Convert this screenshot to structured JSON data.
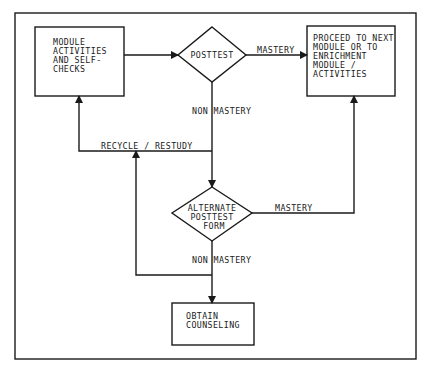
{
  "diagram": {
    "type": "flowchart",
    "colors": {
      "line": "#1a1a1a",
      "background": "#ffffff"
    },
    "nodes": {
      "module_activities": {
        "shape": "rectangle",
        "lines": [
          "MODULE",
          "ACTIVITIES",
          "AND SELF-",
          "CHECKS"
        ]
      },
      "posttest": {
        "shape": "diamond",
        "lines": [
          "POSTTEST"
        ]
      },
      "proceed": {
        "shape": "rectangle",
        "lines": [
          "PROCEED TO NEXT",
          "MODULE OR TO",
          "ENRICHMENT",
          "MODULE /",
          "ACTIVITIES"
        ]
      },
      "alternate_posttest": {
        "shape": "diamond",
        "lines": [
          "ALTERNATE",
          "POSTTEST",
          "FORM"
        ]
      },
      "obtain_counseling": {
        "shape": "rectangle",
        "lines": [
          "OBTAIN",
          "COUNSELING"
        ]
      }
    },
    "edges": {
      "module_to_posttest": {
        "from": "module_activities",
        "to": "posttest",
        "label": ""
      },
      "posttest_mastery": {
        "from": "posttest",
        "to": "proceed",
        "label": "MASTERY"
      },
      "posttest_non_mastery": {
        "from": "posttest",
        "to": "alternate_posttest",
        "label": "NON MASTERY"
      },
      "recycle_restudy": {
        "from": "posttest",
        "to": "module_activities",
        "label": "RECYCLE / RESTUDY"
      },
      "alternate_mastery": {
        "from": "alternate_posttest",
        "to": "proceed",
        "label": "MASTERY"
      },
      "alternate_non_mastery": {
        "from": "alternate_posttest",
        "to": "obtain_counseling",
        "label": "NON MASTERY"
      },
      "alternate_recycle": {
        "from": "alternate_posttest",
        "to": "module_activities",
        "label": ""
      }
    }
  }
}
